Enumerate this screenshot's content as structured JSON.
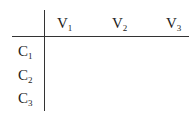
{
  "table": {
    "column_headers": [
      {
        "base": "V",
        "sub": "1"
      },
      {
        "base": "V",
        "sub": "2"
      },
      {
        "base": "V",
        "sub": "3"
      }
    ],
    "row_headers": [
      {
        "base": "C",
        "sub": "1"
      },
      {
        "base": "C",
        "sub": "2"
      },
      {
        "base": "C",
        "sub": "3"
      }
    ],
    "cells": [
      [
        "",
        "",
        ""
      ],
      [
        "",
        "",
        ""
      ],
      [
        "",
        "",
        ""
      ]
    ]
  }
}
